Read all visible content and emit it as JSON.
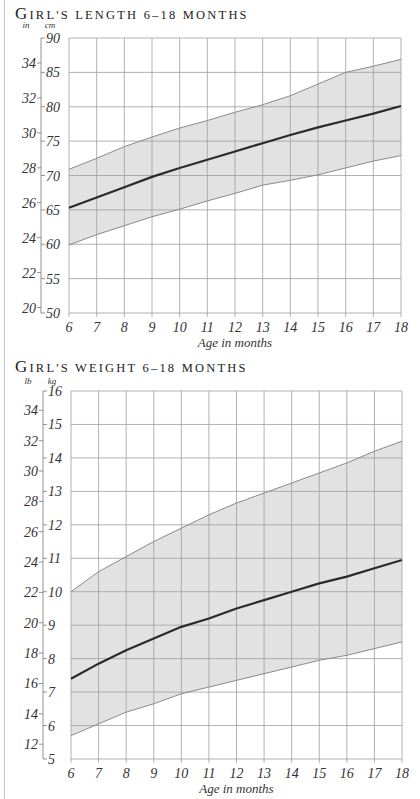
{
  "chart_data": [
    {
      "type": "area",
      "title": "Girl's length 6–18 months",
      "title_cap": "G",
      "title_rest": "irl's length 6–18 months",
      "xlabel": "Age in months",
      "ylabel_left": "in",
      "ylabel_right": "cm",
      "x": [
        6,
        7,
        8,
        9,
        10,
        11,
        12,
        13,
        14,
        15,
        16,
        17,
        18
      ],
      "xlim": [
        6,
        18
      ],
      "ylim": [
        50,
        90
      ],
      "yticks_primary": [
        50,
        55,
        60,
        65,
        70,
        75,
        80,
        85,
        90
      ],
      "yticks_secondary": [
        20,
        22,
        24,
        26,
        28,
        30,
        32,
        34
      ],
      "grid": true,
      "series": [
        {
          "name": "Upper range",
          "values": [
            70.9,
            72.5,
            74.2,
            75.6,
            76.9,
            78.0,
            79.2,
            80.3,
            81.6,
            83.3,
            85.0,
            85.9,
            86.9
          ]
        },
        {
          "name": "Average",
          "values": [
            65.3,
            66.8,
            68.3,
            69.8,
            71.1,
            72.3,
            73.5,
            74.7,
            75.9,
            77.0,
            78.0,
            79.0,
            80.1
          ]
        },
        {
          "name": "Lower range",
          "values": [
            59.9,
            61.4,
            62.7,
            64.0,
            65.1,
            66.3,
            67.4,
            68.6,
            69.3,
            70.1,
            71.1,
            72.1,
            72.9
          ]
        }
      ]
    },
    {
      "type": "area",
      "title": "Girl's weight 6–18 months",
      "title_cap": "G",
      "title_rest": "irl's weight 6–18 months",
      "xlabel": "Age in months",
      "ylabel_left": "lb",
      "ylabel_right": "kg",
      "x": [
        6,
        7,
        8,
        9,
        10,
        11,
        12,
        13,
        14,
        15,
        16,
        17,
        18
      ],
      "xlim": [
        6,
        18
      ],
      "ylim": [
        5,
        16
      ],
      "yticks_primary": [
        5,
        6,
        7,
        8,
        9,
        10,
        11,
        12,
        13,
        14,
        15,
        16
      ],
      "yticks_secondary": [
        12,
        14,
        16,
        18,
        20,
        22,
        24,
        26,
        28,
        30,
        32,
        34
      ],
      "grid": true,
      "series": [
        {
          "name": "Upper range",
          "values": [
            10.0,
            10.6,
            11.05,
            11.5,
            11.9,
            12.3,
            12.65,
            12.95,
            13.25,
            13.55,
            13.85,
            14.2,
            14.5
          ]
        },
        {
          "name": "Average",
          "values": [
            7.4,
            7.85,
            8.25,
            8.6,
            8.95,
            9.2,
            9.5,
            9.75,
            10.0,
            10.25,
            10.45,
            10.7,
            10.95
          ]
        },
        {
          "name": "Lower range",
          "values": [
            5.7,
            6.05,
            6.4,
            6.65,
            6.95,
            7.15,
            7.35,
            7.55,
            7.75,
            7.95,
            8.1,
            8.3,
            8.5
          ]
        }
      ]
    }
  ],
  "colors": {
    "band_fill": "#e2e2e2",
    "grid": "#9e9e9e",
    "range_line": "#8a8a8a",
    "average_line": "#2a2a2a",
    "text": "#333333"
  }
}
